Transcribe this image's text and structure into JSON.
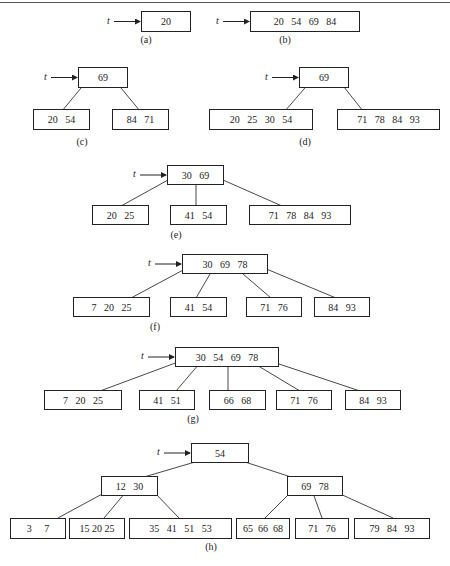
{
  "pointer_label": "t",
  "figures": [
    {
      "id": "a",
      "caption": "(a)",
      "nodes": [
        {
          "keys": "20",
          "x": 141,
          "y": 11,
          "w": 50,
          "h": 21,
          "root": true
        }
      ],
      "edges": []
    },
    {
      "id": "b",
      "caption": "(b)",
      "nodes": [
        {
          "keys": "20   54   69   84",
          "x": 250,
          "y": 11,
          "w": 110,
          "h": 21,
          "root": true
        }
      ],
      "edges": []
    },
    {
      "id": "c",
      "caption": "(c)",
      "nodes": [
        {
          "keys": "69",
          "x": 78,
          "y": 67,
          "w": 50,
          "h": 21,
          "root": true
        },
        {
          "keys": "20   54",
          "x": 33,
          "y": 109,
          "w": 57,
          "h": 21
        },
        {
          "keys": "84   71",
          "x": 112,
          "y": 109,
          "w": 57,
          "h": 21
        }
      ],
      "edges": [
        [
          86,
          82,
          62,
          111
        ],
        [
          116,
          82,
          140,
          111
        ]
      ]
    },
    {
      "id": "d",
      "caption": "(d)",
      "nodes": [
        {
          "keys": "69",
          "x": 299,
          "y": 67,
          "w": 50,
          "h": 21,
          "root": true
        },
        {
          "keys": "20   25   30   54",
          "x": 209,
          "y": 109,
          "w": 104,
          "h": 21
        },
        {
          "keys": "71   78   84   93",
          "x": 337,
          "y": 109,
          "w": 103,
          "h": 21
        }
      ],
      "edges": [
        [
          310,
          82,
          285,
          111
        ],
        [
          340,
          82,
          363,
          111
        ]
      ]
    },
    {
      "id": "e",
      "caption": "(e)",
      "nodes": [
        {
          "keys": "30   69",
          "x": 167,
          "y": 165,
          "w": 57,
          "h": 20,
          "root": true
        },
        {
          "keys": "20   25",
          "x": 92,
          "y": 205,
          "w": 57,
          "h": 20
        },
        {
          "keys": "41   54",
          "x": 170,
          "y": 205,
          "w": 57,
          "h": 20
        },
        {
          "keys": "71   78   84   93",
          "x": 249,
          "y": 205,
          "w": 102,
          "h": 20
        }
      ],
      "edges": [
        [
          168,
          180,
          121,
          206
        ],
        [
          196,
          180,
          196,
          206
        ],
        [
          223,
          180,
          282,
          206
        ]
      ]
    },
    {
      "id": "f",
      "caption": "(f)",
      "nodes": [
        {
          "keys": "30   69   78",
          "x": 182,
          "y": 254,
          "w": 86,
          "h": 20,
          "root": true
        },
        {
          "keys": "7   20   25",
          "x": 73,
          "y": 297,
          "w": 77,
          "h": 20
        },
        {
          "keys": "41   54",
          "x": 170,
          "y": 297,
          "w": 57,
          "h": 20
        },
        {
          "keys": "71   76",
          "x": 246,
          "y": 297,
          "w": 56,
          "h": 20
        },
        {
          "keys": "84   93",
          "x": 314,
          "y": 297,
          "w": 56,
          "h": 20
        }
      ],
      "edges": [
        [
          185,
          269,
          131,
          298
        ],
        [
          210,
          274,
          196,
          298
        ],
        [
          243,
          274,
          271,
          298
        ],
        [
          264,
          268,
          336,
          298
        ]
      ]
    },
    {
      "id": "g",
      "caption": "(g)",
      "nodes": [
        {
          "keys": "30   54   69   78",
          "x": 175,
          "y": 347,
          "w": 104,
          "h": 20,
          "root": true
        },
        {
          "keys": "7   20   25",
          "x": 44,
          "y": 390,
          "w": 78,
          "h": 20
        },
        {
          "keys": "41   51",
          "x": 139,
          "y": 390,
          "w": 56,
          "h": 20
        },
        {
          "keys": "66   68",
          "x": 209,
          "y": 390,
          "w": 57,
          "h": 20
        },
        {
          "keys": "71   76",
          "x": 276,
          "y": 390,
          "w": 56,
          "h": 20
        },
        {
          "keys": "84   93",
          "x": 345,
          "y": 390,
          "w": 56,
          "h": 20
        }
      ],
      "edges": [
        [
          178,
          362,
          100,
          391
        ],
        [
          199,
          364,
          176,
          391
        ],
        [
          228,
          364,
          228,
          391
        ],
        [
          255,
          364,
          300,
          391
        ],
        [
          273,
          362,
          360,
          391
        ]
      ]
    },
    {
      "id": "h",
      "caption": "(h)",
      "nodes": [
        {
          "keys": "54",
          "x": 191,
          "y": 443,
          "w": 58,
          "h": 20,
          "root": true
        },
        {
          "keys": "12   30",
          "x": 101,
          "y": 476,
          "w": 57,
          "h": 20
        },
        {
          "keys": "69   78",
          "x": 287,
          "y": 476,
          "w": 56,
          "h": 20
        },
        {
          "keys": "3     7",
          "x": 10,
          "y": 518,
          "w": 56,
          "h": 21
        },
        {
          "keys": "15 20 25",
          "x": 69,
          "y": 518,
          "w": 56,
          "h": 21
        },
        {
          "keys": "35   41   51   53",
          "x": 129,
          "y": 518,
          "w": 103,
          "h": 21
        },
        {
          "keys": "65  66  68",
          "x": 236,
          "y": 518,
          "w": 54,
          "h": 21
        },
        {
          "keys": "71   76",
          "x": 295,
          "y": 518,
          "w": 54,
          "h": 21
        },
        {
          "keys": "79   84   93",
          "x": 354,
          "y": 518,
          "w": 76,
          "h": 21
        }
      ],
      "edges": [
        [
          195,
          462,
          144,
          477
        ],
        [
          245,
          462,
          291,
          477
        ],
        [
          104,
          493,
          58,
          518
        ],
        [
          125,
          493,
          104,
          518
        ],
        [
          155,
          493,
          179,
          518
        ],
        [
          290,
          493,
          265,
          518
        ],
        [
          313,
          493,
          322,
          518
        ],
        [
          338,
          493,
          393,
          518
        ]
      ]
    }
  ],
  "captions_pos": {
    "a": [
      146,
      38
    ],
    "b": [
      285,
      38
    ],
    "c": [
      82,
      140
    ],
    "d": [
      305,
      140
    ],
    "e": [
      176,
      233
    ],
    "f": [
      155,
      325
    ],
    "g": [
      193,
      417
    ],
    "h": [
      211,
      545
    ]
  }
}
